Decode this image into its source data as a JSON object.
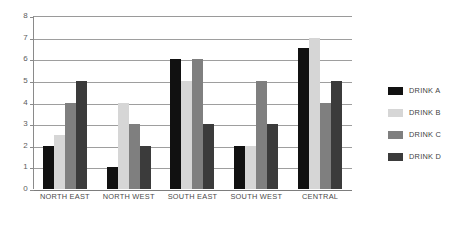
{
  "chart_data": {
    "type": "bar",
    "title": "",
    "xlabel": "",
    "ylabel": "",
    "ylim": [
      0,
      8
    ],
    "yticks": [
      0,
      1,
      2,
      3,
      4,
      5,
      6,
      7,
      8
    ],
    "ytick_labels": [
      "0",
      "1",
      "2",
      "3",
      "4",
      "5",
      "6",
      "7",
      "8"
    ],
    "grid": true,
    "legend_position": "right",
    "categories": [
      "NORTH EAST",
      "NORTH WEST",
      "SOUTH EAST",
      "SOUTH WEST",
      "CENTRAL"
    ],
    "series": [
      {
        "name": "DRINK A",
        "color": "#111111",
        "values": [
          2,
          1,
          6,
          2,
          6.5
        ]
      },
      {
        "name": "DRINK B",
        "color": "#d6d6d6",
        "values": [
          2.5,
          4,
          5,
          2,
          7
        ]
      },
      {
        "name": "DRINK C",
        "color": "#7f7f7f",
        "values": [
          4,
          3,
          6,
          5,
          4
        ]
      },
      {
        "name": "DRINK D",
        "color": "#3b3b3b",
        "values": [
          5,
          2,
          3,
          3,
          5
        ]
      }
    ]
  }
}
